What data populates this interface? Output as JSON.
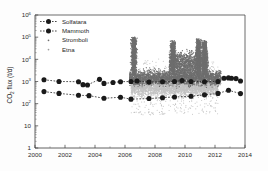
{
  "chart_data": {
    "type": "scatter",
    "title": "",
    "xlabel": "",
    "ylabel": "CO2 flux (t/d)",
    "ylabel_main": "CO",
    "ylabel_sub": "2",
    "ylabel_rest": " flux (t/d)",
    "xlim": [
      2000,
      2014
    ],
    "ylim": [
      1,
      1000000
    ],
    "yscale": "log",
    "grid": false,
    "legend_position": "upper-left",
    "xticks": [
      "2000",
      "2002",
      "2004",
      "2006",
      "2008",
      "2010",
      "2012",
      "2014"
    ],
    "xtick_values": [
      2000,
      2002,
      2004,
      2006,
      2008,
      2010,
      2012,
      2014
    ],
    "yticks": [
      "10^6",
      "10^5",
      "10^4",
      "10^3",
      "10^2",
      "10",
      "1"
    ],
    "ytick_values": [
      1000000,
      100000,
      10000,
      1000,
      100,
      10,
      1
    ],
    "ytick_mantissa": [
      "10",
      "10",
      "10",
      "10",
      "10",
      "10",
      "1"
    ],
    "ytick_exponent": [
      "6",
      "5",
      "4",
      "3",
      "2",
      "",
      ""
    ],
    "legend": [
      {
        "name": "Solfatara",
        "style": "dashed-line-marker",
        "color": "#1a1a1a"
      },
      {
        "name": "Mammoth",
        "style": "dashed-line-marker",
        "color": "#1a1a1a"
      },
      {
        "name": "Stromboli",
        "style": "dots",
        "color": "#6e6e6e"
      },
      {
        "name": "Etna",
        "style": "dots",
        "color": "#c2c2c2"
      }
    ],
    "series": [
      {
        "name": "Solfatara",
        "type": "line-marker",
        "x": [
          2000.6,
          2001.6,
          2002.9,
          2003.2,
          2003.5,
          2004.3,
          2004.6,
          2005.2,
          2005.7,
          2006.4,
          2006.8,
          2007.6,
          2008.5,
          2009.3,
          2009.8,
          2010.4,
          2011.3,
          2012.2,
          2012.6,
          2012.9,
          2013.1,
          2013.4,
          2013.7
        ],
        "y": [
          1200,
          1000,
          980,
          720,
          700,
          1250,
          820,
          900,
          980,
          1000,
          1050,
          940,
          980,
          1000,
          1100,
          1000,
          980,
          1000,
          1400,
          1450,
          1400,
          1350,
          1050
        ]
      },
      {
        "name": "Mammoth",
        "type": "line-marker",
        "x": [
          2000.6,
          2001.6,
          2002.9,
          2003.6,
          2004.6,
          2005.7,
          2006.4,
          2007.6,
          2008.5,
          2009.3,
          2010.4,
          2011.3,
          2012.2,
          2012.9,
          2013.7
        ],
        "y": [
          350,
          290,
          240,
          230,
          175,
          195,
          160,
          170,
          185,
          200,
          215,
          250,
          290,
          400,
          285
        ]
      },
      {
        "name": "Stromboli",
        "type": "dots",
        "color": "#6e6e6e",
        "x_range": [
          2006.3,
          2012.4
        ],
        "y_range": [
          200,
          100000
        ],
        "peaks": [
          {
            "x": 2006.6,
            "y": 90000
          },
          {
            "x": 2009.2,
            "y": 55000
          },
          {
            "x": 2010.9,
            "y": 70000
          },
          {
            "x": 2011.3,
            "y": 60000
          }
        ],
        "baseline": 1500
      },
      {
        "name": "Etna",
        "type": "dots",
        "color": "#c2c2c2",
        "x_range": [
          2006.4,
          2012.2
        ],
        "y_range": [
          30,
          12000
        ],
        "baseline": 600
      }
    ]
  },
  "figure": {
    "background_color": "#fdfdfd",
    "axis_color": "#3a3a3a"
  }
}
